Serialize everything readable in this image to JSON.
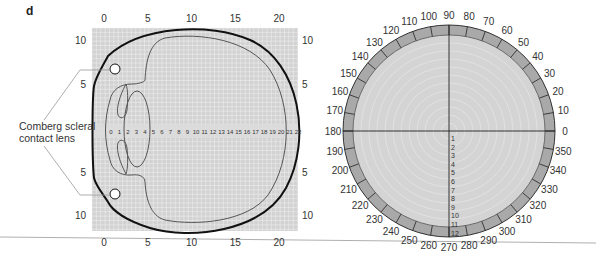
{
  "panel_label": "d",
  "callout": {
    "line1": "Comberg scleral",
    "line2": "contact lens"
  },
  "eye_diagram": {
    "top_axis_ticks": [
      "0",
      "5",
      "10",
      "15",
      "20"
    ],
    "bottom_axis_ticks": [
      "0",
      "5",
      "10",
      "15",
      "20"
    ],
    "left_axis_ticks": [
      "10",
      "5",
      "5",
      "10"
    ],
    "right_axis_ticks": [
      "10",
      "5",
      "5",
      "10"
    ],
    "horizontal_scale": [
      "0",
      "1",
      "2",
      "3",
      "4",
      "5",
      "6",
      "7",
      "8",
      "9",
      "10",
      "11",
      "12",
      "13",
      "14",
      "15",
      "16",
      "17",
      "18",
      "19",
      "20",
      "21",
      "22"
    ],
    "grid_color": "#d2d2d2",
    "gridline_color": "#f2f2f2"
  },
  "polar_chart": {
    "angle_labels": [
      "0",
      "10",
      "20",
      "30",
      "40",
      "50",
      "60",
      "70",
      "80",
      "90",
      "100",
      "110",
      "120",
      "130",
      "140",
      "150",
      "160",
      "170",
      "180",
      "190",
      "200",
      "210",
      "220",
      "230",
      "240",
      "250",
      "260",
      "270",
      "280",
      "290",
      "300",
      "310",
      "320",
      "330",
      "340",
      "350"
    ],
    "radial_labels": [
      "1",
      "2",
      "3",
      "4",
      "5",
      "6",
      "7",
      "8",
      "9",
      "10",
      "11",
      "12"
    ],
    "ring_color": "#a9a9a9",
    "fill_color": "#d4d4d4"
  }
}
